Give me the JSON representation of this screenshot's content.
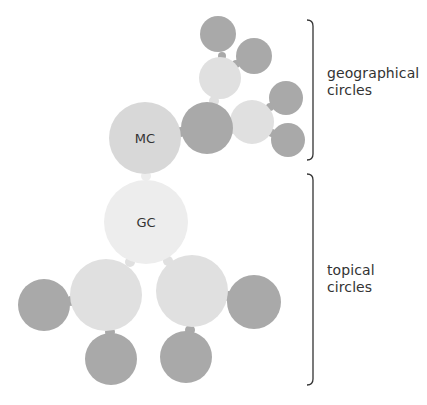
{
  "diagram": {
    "title": "",
    "colors": {
      "dark_circle": "#a9a9a9",
      "light_circle": "#e0e0e0",
      "mc_circle": "#d8d8d8",
      "gc_circle": "#ededed",
      "bracket": "#333333",
      "text": "#333333"
    },
    "nodes": [
      {
        "id": "mc",
        "label": "MC",
        "cx": 145,
        "cy": 138,
        "r": 36,
        "tone": "mc"
      },
      {
        "id": "gc",
        "label": "GC",
        "cx": 146,
        "cy": 222,
        "r": 42,
        "tone": "gc"
      },
      {
        "id": "geo-hub",
        "label": "",
        "cx": 207,
        "cy": 128,
        "r": 26,
        "tone": "dark"
      },
      {
        "id": "geo-upper",
        "label": "",
        "cx": 220,
        "cy": 78,
        "r": 21,
        "tone": "light"
      },
      {
        "id": "geo-upper-a",
        "label": "",
        "cx": 218,
        "cy": 34,
        "r": 18,
        "tone": "dark"
      },
      {
        "id": "geo-upper-b",
        "label": "",
        "cx": 254,
        "cy": 56,
        "r": 18,
        "tone": "dark"
      },
      {
        "id": "geo-right",
        "label": "",
        "cx": 252,
        "cy": 122,
        "r": 22,
        "tone": "light"
      },
      {
        "id": "geo-right-a",
        "label": "",
        "cx": 286,
        "cy": 98,
        "r": 17,
        "tone": "dark"
      },
      {
        "id": "geo-right-b",
        "label": "",
        "cx": 288,
        "cy": 140,
        "r": 17,
        "tone": "dark"
      },
      {
        "id": "topic-left",
        "label": "",
        "cx": 106,
        "cy": 295,
        "r": 36,
        "tone": "light"
      },
      {
        "id": "topic-left-a",
        "label": "",
        "cx": 44,
        "cy": 305,
        "r": 26,
        "tone": "dark"
      },
      {
        "id": "topic-left-b",
        "label": "",
        "cx": 111,
        "cy": 359,
        "r": 26,
        "tone": "dark"
      },
      {
        "id": "topic-right",
        "label": "",
        "cx": 192,
        "cy": 291,
        "r": 36,
        "tone": "light"
      },
      {
        "id": "topic-right-a",
        "label": "",
        "cx": 254,
        "cy": 302,
        "r": 27,
        "tone": "dark"
      },
      {
        "id": "topic-right-b",
        "label": "",
        "cx": 186,
        "cy": 357,
        "r": 26,
        "tone": "dark"
      }
    ],
    "connectors": [
      {
        "from": "mc",
        "to": "gc",
        "x": 146,
        "y": 176,
        "r": 5
      },
      {
        "from": "mc",
        "to": "geo-hub",
        "x": 181,
        "y": 132,
        "r": 5
      },
      {
        "from": "geo-hub",
        "to": "geo-upper",
        "x": 214,
        "y": 101,
        "r": 5
      },
      {
        "from": "geo-upper",
        "to": "geo-upper-a",
        "x": 222,
        "y": 56,
        "r": 4
      },
      {
        "from": "geo-upper",
        "to": "geo-upper-b",
        "x": 236,
        "y": 64,
        "r": 4
      },
      {
        "from": "geo-hub",
        "to": "geo-right",
        "x": 230,
        "y": 130,
        "r": 5
      },
      {
        "from": "geo-right",
        "to": "geo-right-a",
        "x": 270,
        "y": 107,
        "r": 4
      },
      {
        "from": "geo-right",
        "to": "geo-right-b",
        "x": 272,
        "y": 133,
        "r": 4
      },
      {
        "from": "gc",
        "to": "topic-left",
        "x": 130,
        "y": 262,
        "r": 5
      },
      {
        "from": "gc",
        "to": "topic-right",
        "x": 168,
        "y": 261,
        "r": 5
      },
      {
        "from": "topic-left",
        "to": "topic-left-a",
        "x": 71,
        "y": 301,
        "r": 5
      },
      {
        "from": "topic-left",
        "to": "topic-left-b",
        "x": 110,
        "y": 332,
        "r": 5
      },
      {
        "from": "topic-right",
        "to": "topic-right-a",
        "x": 228,
        "y": 296,
        "r": 5
      },
      {
        "from": "topic-right",
        "to": "topic-right-b",
        "x": 190,
        "y": 330,
        "r": 5
      }
    ],
    "groups": [
      {
        "id": "geographical",
        "label_line1": "geographical",
        "label_line2": "circles",
        "bracket": {
          "x": 313,
          "y1": 20,
          "y2": 160
        }
      },
      {
        "id": "topical",
        "label_line1": "topical",
        "label_line2": "circles",
        "bracket": {
          "x": 313,
          "y1": 174,
          "y2": 385
        }
      }
    ]
  }
}
